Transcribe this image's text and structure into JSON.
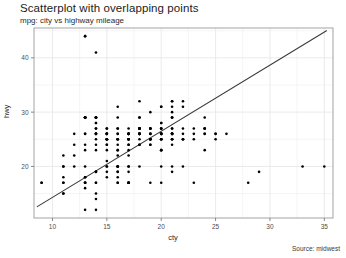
{
  "chart_data": {
    "type": "scatter",
    "title": "Scatterplot with overlapping points",
    "subtitle": "mpg: city vs highway mileage",
    "caption": "Source: midwest",
    "xlabel": "cty",
    "ylabel": "hwy",
    "xlim": [
      8.3,
      35.8
    ],
    "ylim": [
      10.5,
      45.5
    ],
    "xticks": [
      10,
      15,
      20,
      25,
      30,
      35
    ],
    "yticks": [
      20,
      30,
      40
    ],
    "xtick_labels": [
      "10",
      "15",
      "20",
      "25",
      "30",
      "35"
    ],
    "ytick_labels": [
      "20",
      "30",
      "40"
    ],
    "grid": true,
    "grid_color": "#e8e8e8",
    "minor_grid": true,
    "legend": null,
    "point_color": "#000000",
    "point_size": 2.6,
    "line_color": "#3a3a3a",
    "trend": {
      "type": "linear",
      "x0": 8.6,
      "y0": 12.6,
      "x1": 35.2,
      "y1": 45.0
    },
    "x": [
      18,
      21,
      20,
      21,
      16,
      18,
      18,
      18,
      16,
      20,
      19,
      15,
      17,
      17,
      15,
      15,
      17,
      16,
      14,
      11,
      14,
      13,
      12,
      16,
      15,
      16,
      15,
      15,
      14,
      11,
      11,
      14,
      19,
      22,
      18,
      18,
      17,
      18,
      17,
      16,
      16,
      17,
      17,
      11,
      15,
      15,
      16,
      16,
      15,
      14,
      13,
      14,
      14,
      14,
      9,
      11,
      11,
      13,
      13,
      9,
      13,
      11,
      13,
      11,
      12,
      12,
      13,
      14,
      13,
      13,
      14,
      14,
      13,
      13,
      13,
      13,
      14,
      14,
      13,
      13,
      13,
      13,
      12,
      13,
      14,
      14,
      13,
      14,
      14,
      13,
      13,
      14,
      14,
      17,
      16,
      15,
      15,
      15,
      14,
      15,
      14,
      16,
      16,
      15,
      14,
      13,
      14,
      14,
      15,
      15,
      15,
      14,
      14,
      15,
      15,
      16,
      17,
      16,
      16,
      16,
      15,
      16,
      18,
      18,
      17,
      17,
      17,
      16,
      17,
      16,
      17,
      16,
      17,
      17,
      18,
      20,
      19,
      20,
      18,
      21,
      19,
      19,
      20,
      20,
      21,
      21,
      20,
      21,
      20,
      18,
      19,
      21,
      20,
      21,
      20,
      18,
      19,
      21,
      24,
      20,
      21,
      20,
      21,
      21,
      20,
      21,
      21,
      24,
      25,
      23,
      24,
      26,
      25,
      24,
      21,
      22,
      23,
      22,
      20,
      33,
      35,
      29,
      28,
      22,
      23,
      24,
      22,
      21,
      21,
      21,
      24,
      25,
      23,
      21,
      19,
      18,
      19,
      19,
      20,
      20,
      18,
      18,
      17,
      17,
      18,
      17,
      16,
      16,
      17,
      17,
      17,
      16,
      17,
      21,
      19,
      22,
      22,
      24,
      20,
      21,
      20,
      22,
      19,
      18,
      19,
      20,
      20,
      19,
      20,
      18,
      18,
      19,
      19,
      20,
      17
    ],
    "y": [
      29,
      29,
      31,
      30,
      26,
      26,
      27,
      26,
      25,
      28,
      27,
      25,
      25,
      25,
      24,
      25,
      23,
      20,
      15,
      20,
      17,
      17,
      26,
      23,
      26,
      25,
      24,
      19,
      14,
      15,
      17,
      27,
      30,
      26,
      29,
      26,
      24,
      24,
      22,
      22,
      24,
      24,
      17,
      22,
      21,
      23,
      23,
      19,
      18,
      17,
      17,
      19,
      19,
      12,
      17,
      15,
      17,
      17,
      12,
      17,
      16,
      18,
      18,
      20,
      20,
      22,
      17,
      19,
      18,
      20,
      29,
      26,
      29,
      29,
      24,
      44,
      29,
      26,
      29,
      29,
      29,
      23,
      24,
      44,
      41,
      29,
      26,
      28,
      29,
      29,
      29,
      28,
      29,
      26,
      26,
      26,
      25,
      26,
      26,
      25,
      24,
      27,
      25,
      26,
      23,
      26,
      26,
      26,
      26,
      25,
      27,
      25,
      27,
      20,
      20,
      19,
      17,
      20,
      17,
      29,
      27,
      31,
      32,
      27,
      26,
      26,
      25,
      25,
      17,
      17,
      20,
      18,
      26,
      26,
      27,
      28,
      25,
      25,
      24,
      27,
      25,
      26,
      23,
      26,
      26,
      26,
      26,
      25,
      27,
      25,
      27,
      20,
      20,
      19,
      17,
      20,
      17,
      29,
      27,
      31,
      32,
      27,
      26,
      26,
      25,
      25,
      24,
      27,
      25,
      26,
      23,
      26,
      26,
      26,
      26,
      25,
      27,
      25,
      27,
      20,
      20,
      19,
      17,
      20,
      17,
      29,
      27,
      31,
      32,
      27,
      26,
      26,
      25,
      25,
      24,
      27,
      25,
      26,
      23,
      26,
      26,
      26,
      26,
      25,
      27,
      25,
      27,
      20,
      20,
      19,
      17,
      20,
      17,
      29,
      27,
      31,
      32,
      27,
      26,
      26,
      25,
      25,
      24,
      27,
      25,
      26,
      23,
      26,
      26,
      26,
      26,
      25,
      27,
      25,
      27
    ]
  },
  "plot": {
    "panel_left": 34,
    "panel_top": 28,
    "panel_right": 333,
    "panel_bottom": 218
  }
}
